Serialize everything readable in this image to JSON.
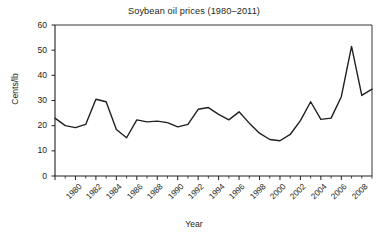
{
  "chart_data": {
    "type": "line",
    "title": "Soybean oil prices (1980–2011)",
    "xlabel": "Year",
    "ylabel": "Cents/lb",
    "xlim": [
      1980,
      2011
    ],
    "ylim": [
      0,
      60
    ],
    "ytick_labels": [
      "0",
      "10",
      "20",
      "30",
      "40",
      "50",
      "60"
    ],
    "ytick_values": [
      0,
      10,
      20,
      30,
      40,
      50,
      60
    ],
    "xtick_labels": [
      "1980",
      "1982",
      "1984",
      "1986",
      "1988",
      "1990",
      "1992",
      "1994",
      "1996",
      "1998",
      "2000",
      "2002",
      "2004",
      "2006",
      "2008"
    ],
    "xtick_values": [
      1980,
      1982,
      1984,
      1986,
      1988,
      1990,
      1992,
      1994,
      1996,
      1998,
      2000,
      2002,
      2004,
      2006,
      2008
    ],
    "minor_xticks_every": 1,
    "grid": false,
    "legend": null,
    "line_color": "#231f20",
    "line_width": 1.4,
    "x": [
      1980,
      1981,
      1982,
      1983,
      1984,
      1985,
      1986,
      1987,
      1988,
      1989,
      1990,
      1991,
      1992,
      1993,
      1994,
      1995,
      1996,
      1997,
      1998,
      1999,
      2000,
      2001,
      2002,
      2003,
      2004,
      2005,
      2006,
      2007,
      2008,
      2009,
      2010
    ],
    "values": [
      23.0,
      20.0,
      19.2,
      20.5,
      30.5,
      29.5,
      18.5,
      15.2,
      22.3,
      21.5,
      21.8,
      21.2,
      19.5,
      20.5,
      26.5,
      27.2,
      24.5,
      22.3,
      25.5,
      21.0,
      17.0,
      14.5,
      14.0,
      16.5,
      22.0,
      29.5,
      22.5,
      23.0,
      31.5,
      51.5,
      32.0
    ],
    "values_tail": [
      34.5
    ],
    "series_name": "Soybean oil price"
  },
  "axes": {
    "plot_left": 55,
    "plot_right": 372,
    "plot_top": 25,
    "plot_bottom": 176
  }
}
